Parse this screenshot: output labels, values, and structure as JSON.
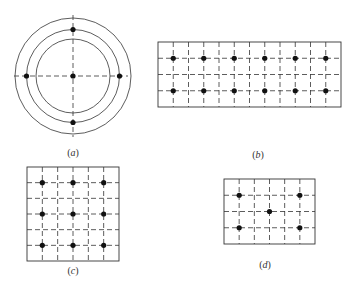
{
  "figure": {
    "width": 347,
    "height": 282,
    "line_color": "#333333",
    "dot_color": "#111111",
    "dot_radius": 2.6,
    "dash": "5,3",
    "panels": [
      {
        "id": "a",
        "label": "a",
        "type": "concentric-circles",
        "center": [
          73,
          76
        ],
        "radii": [
          37,
          46.5,
          58
        ],
        "axes": {
          "h": [
            14,
            128
          ],
          "v": [
            15,
            137
          ]
        },
        "dots": [
          [
            73,
            76
          ],
          [
            73,
            29.5
          ],
          [
            73,
            122.5
          ],
          [
            26.5,
            76
          ],
          [
            119.5,
            76
          ]
        ],
        "label_pos": [
          73,
          152
        ]
      },
      {
        "id": "b",
        "label": "b",
        "type": "grid",
        "rect": [
          158,
          42,
          341,
          107
        ],
        "cols": 12,
        "rows": 4,
        "dot_cells": "odd-lines",
        "dots": [
          [
            173.25,
            58.25
          ],
          [
            203.75,
            58.25
          ],
          [
            234.25,
            58.25
          ],
          [
            264.75,
            58.25
          ],
          [
            295.25,
            58.25
          ],
          [
            325.75,
            58.25
          ],
          [
            173.25,
            90.75
          ],
          [
            203.75,
            90.75
          ],
          [
            234.25,
            90.75
          ],
          [
            264.75,
            90.75
          ],
          [
            295.25,
            90.75
          ],
          [
            325.75,
            90.75
          ]
        ],
        "label_pos": [
          258,
          154
        ]
      },
      {
        "id": "c",
        "label": "c",
        "type": "grid",
        "rect": [
          27,
          167,
          119,
          261
        ],
        "cols": 6,
        "rows": 6,
        "dots": [
          [
            42.3,
            182.7
          ],
          [
            73,
            182.7
          ],
          [
            103.7,
            182.7
          ],
          [
            42.3,
            214
          ],
          [
            73,
            214
          ],
          [
            103.7,
            214
          ],
          [
            42.3,
            245.3
          ],
          [
            73,
            245.3
          ],
          [
            103.7,
            245.3
          ]
        ],
        "label_pos": [
          73,
          270
        ]
      },
      {
        "id": "d",
        "label": "d",
        "type": "grid",
        "rect": [
          224,
          179,
          315,
          244
        ],
        "cols": 6,
        "rows": 4,
        "dots": [
          [
            239.2,
            195.25
          ],
          [
            299.8,
            195.25
          ],
          [
            269.5,
            211.5
          ],
          [
            239.2,
            227.75
          ],
          [
            299.8,
            227.75
          ]
        ],
        "label_pos": [
          265,
          264
        ]
      }
    ]
  },
  "labels": {
    "a": "a",
    "b": "b",
    "c": "c",
    "d": "d"
  }
}
